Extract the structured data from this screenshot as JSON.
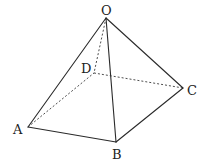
{
  "diagram": {
    "type": "square pyramid",
    "vertices": [
      {
        "id": "O",
        "label": "O",
        "x": 106,
        "y": 18,
        "lx": 101,
        "ly": 15
      },
      {
        "id": "A",
        "label": "A",
        "x": 28,
        "y": 127,
        "lx": 13,
        "ly": 134
      },
      {
        "id": "B",
        "label": "B",
        "x": 116,
        "y": 142,
        "lx": 112,
        "ly": 159
      },
      {
        "id": "C",
        "label": "C",
        "x": 183,
        "y": 88,
        "lx": 187,
        "ly": 95
      },
      {
        "id": "D",
        "label": "D",
        "x": 94,
        "y": 73,
        "lx": 81,
        "ly": 73
      }
    ],
    "edges_visible": [
      [
        "O",
        "A"
      ],
      [
        "O",
        "B"
      ],
      [
        "O",
        "C"
      ],
      [
        "A",
        "B"
      ],
      [
        "B",
        "C"
      ]
    ],
    "edges_hidden": [
      [
        "O",
        "D"
      ],
      [
        "A",
        "D"
      ],
      [
        "D",
        "C"
      ]
    ]
  }
}
